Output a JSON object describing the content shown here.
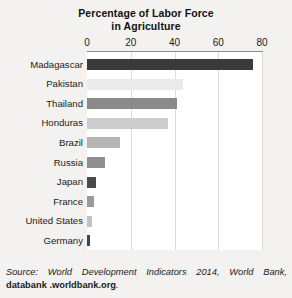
{
  "chart_data": {
    "type": "bar",
    "orientation": "horizontal",
    "title": "Percentage of Labor Force in Agriculture",
    "title_lines": [
      "Percentage of Labor Force",
      "in Agriculture"
    ],
    "xlabel": "",
    "ylabel": "",
    "xlim": [
      0,
      80
    ],
    "xticks": [
      0,
      20,
      40,
      60,
      80
    ],
    "xtick_labels": [
      "0",
      "20",
      "40",
      "60",
      "80"
    ],
    "grid": true,
    "axis_position": "top",
    "legend": "none",
    "categories": [
      "Madagascar",
      "Pakistan",
      "Thailand",
      "Honduras",
      "Brazil",
      "Russia",
      "Japan",
      "France",
      "United States",
      "Germany"
    ],
    "values": [
      76,
      44,
      41,
      37,
      15,
      8,
      4,
      3,
      2.5,
      1.5
    ],
    "bar_colors": [
      "#3a3a3a",
      "#eaeaea",
      "#8a8a8a",
      "#cccccc",
      "#b4b4b4",
      "#8f8f8f",
      "#4a4a4a",
      "#9a9a9a",
      "#c2c2c2",
      "#444444"
    ]
  },
  "source": {
    "prefix": "Source: World Development Indicators 2014, World Bank, ",
    "bold": "databank .worldbank.org",
    "suffix": "."
  },
  "colors": {
    "page_background": "#f3f2f0",
    "plot_background": "#ffffff",
    "axis": "#8d8d8d",
    "gridline": "#dcdcdc",
    "text": "#1b1b1b"
  }
}
